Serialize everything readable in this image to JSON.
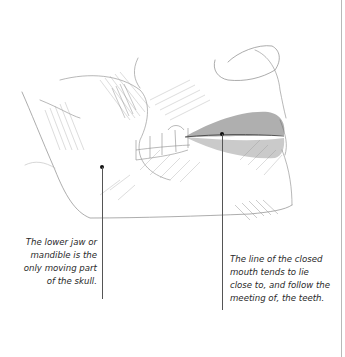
{
  "illustration": {
    "subject": "pencil sketch of lower face: jaw, teeth and closed mouth in profile",
    "border_color": "#b8b8b8",
    "leader_color": "#555555"
  },
  "annotations": [
    {
      "id": "lower-jaw",
      "lines": [
        "The lower jaw or",
        "mandible is the",
        "only moving part",
        "of the skull."
      ]
    },
    {
      "id": "closed-mouth",
      "lines": [
        "The line of the closed",
        "mouth tends to lie",
        "close to, and follow the",
        "meeting of, the teeth."
      ]
    }
  ]
}
